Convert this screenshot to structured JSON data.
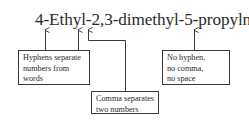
{
  "diagram": {
    "compound_name": "4-Ethyl-2,3-dimethyl-5-propylnonane",
    "annotations": [
      {
        "id": "hyphens",
        "lines": [
          "Hyphens separate",
          "numbers from",
          "words"
        ],
        "points_to": [
          "hyphen after 4",
          "hyphen after Ethyl"
        ]
      },
      {
        "id": "comma",
        "lines": [
          "Comma separates",
          "two numbers"
        ],
        "points_to": [
          "comma between 2 and 3"
        ]
      },
      {
        "id": "no-separator",
        "lines": [
          "No hyphen,",
          "no comma,",
          "no space"
        ],
        "points_to": [
          "junction of propyl and nonane"
        ]
      }
    ],
    "colors": {
      "line": "#3a3a3a",
      "text": "#2a2a2a",
      "background": "#ffffff"
    }
  }
}
